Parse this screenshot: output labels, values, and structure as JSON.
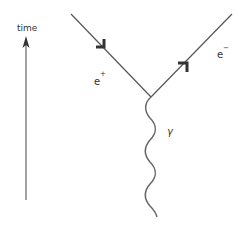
{
  "diagram": {
    "type": "feynman",
    "time_axis": {
      "label": "time"
    },
    "particles": {
      "positron": {
        "base": "e",
        "sup": "+"
      },
      "electron": {
        "base": "e",
        "sup": "−"
      },
      "photon": {
        "label": "γ"
      }
    },
    "colors": {
      "line": "#555555",
      "arrow": "#333333",
      "text": "#333333"
    }
  }
}
